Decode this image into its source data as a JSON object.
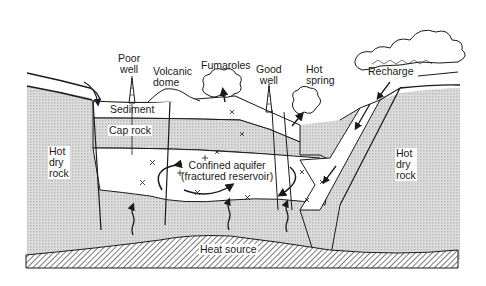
{
  "diagram": {
    "type": "geothermal-system-cross-section",
    "colors": {
      "line": "#1a1a1a",
      "rock_fill": "#d4d4d4",
      "layer_fill": "#ffffff",
      "background": "#ffffff"
    },
    "labels": {
      "poor_well": [
        "Poor",
        "well"
      ],
      "volcanic_dome": [
        "Volcanic",
        "dome"
      ],
      "fumaroles": "Fumaroles",
      "good_well": [
        "Good",
        "well"
      ],
      "hot_spring": [
        "Hot",
        "spring"
      ],
      "recharge": "Recharge",
      "sediment": "Sediment",
      "cap_rock": "Cap rock",
      "hot_dry_rock_left": [
        "Hot",
        "dry",
        "rock"
      ],
      "hot_dry_rock_right": [
        "Hot",
        "dry",
        "rock"
      ],
      "confined_aquifer": [
        "Confined aquifer",
        "(fractured reservoir)"
      ],
      "heat_source": "Heat source"
    }
  }
}
